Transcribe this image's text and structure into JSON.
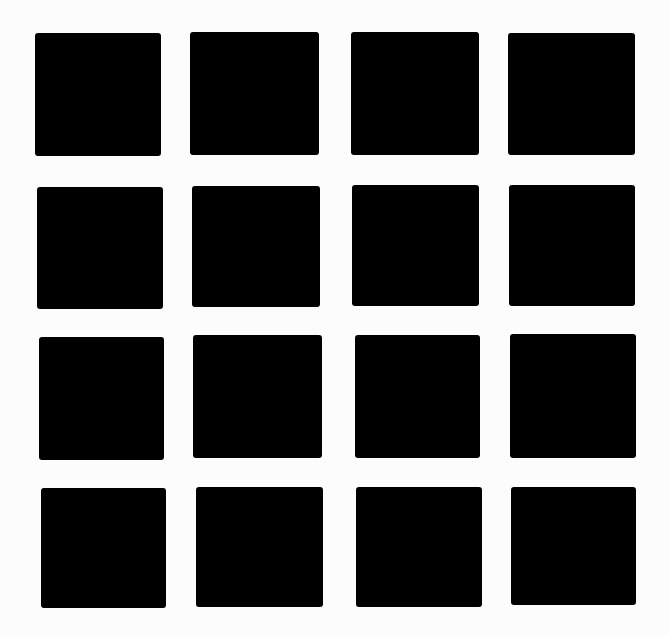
{
  "figure": {
    "background_color": "#fcfcfc",
    "square_color": "#000000",
    "rows": 4,
    "cols": 4,
    "squares": [
      {
        "row": 1,
        "col": 1,
        "x": 35,
        "y": 33,
        "w": 126,
        "h": 123
      },
      {
        "row": 1,
        "col": 2,
        "x": 190,
        "y": 32,
        "w": 129,
        "h": 123
      },
      {
        "row": 1,
        "col": 3,
        "x": 351,
        "y": 32,
        "w": 128,
        "h": 123
      },
      {
        "row": 1,
        "col": 4,
        "x": 508,
        "y": 33,
        "w": 127,
        "h": 122
      },
      {
        "row": 2,
        "col": 1,
        "x": 37,
        "y": 187,
        "w": 126,
        "h": 122
      },
      {
        "row": 2,
        "col": 2,
        "x": 192,
        "y": 186,
        "w": 128,
        "h": 121
      },
      {
        "row": 2,
        "col": 3,
        "x": 352,
        "y": 185,
        "w": 127,
        "h": 121
      },
      {
        "row": 2,
        "col": 4,
        "x": 509,
        "y": 185,
        "w": 126,
        "h": 121
      },
      {
        "row": 3,
        "col": 1,
        "x": 39,
        "y": 337,
        "w": 125,
        "h": 123
      },
      {
        "row": 3,
        "col": 2,
        "x": 193,
        "y": 335,
        "w": 129,
        "h": 123
      },
      {
        "row": 3,
        "col": 3,
        "x": 355,
        "y": 335,
        "w": 125,
        "h": 123
      },
      {
        "row": 3,
        "col": 4,
        "x": 510,
        "y": 334,
        "w": 126,
        "h": 124
      },
      {
        "row": 4,
        "col": 1,
        "x": 41,
        "y": 488,
        "w": 125,
        "h": 120
      },
      {
        "row": 4,
        "col": 2,
        "x": 196,
        "y": 487,
        "w": 127,
        "h": 120
      },
      {
        "row": 4,
        "col": 3,
        "x": 356,
        "y": 487,
        "w": 126,
        "h": 120
      },
      {
        "row": 4,
        "col": 4,
        "x": 511,
        "y": 487,
        "w": 125,
        "h": 118
      }
    ]
  }
}
